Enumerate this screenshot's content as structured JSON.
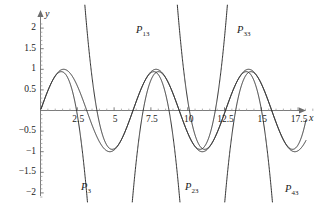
{
  "chart_data": {
    "type": "line",
    "title": "",
    "xlabel": "x",
    "ylabel": "y",
    "xlim": [
      -0.6,
      19.2
    ],
    "ylim": [
      -2.15,
      2.2
    ],
    "grid": false,
    "legend_position": "inline-curve-labels",
    "x_ticks": [
      2.5,
      5,
      7.5,
      10,
      12.5,
      15,
      17.5
    ],
    "x_tick_labels": [
      "2.5",
      "5",
      "7.5",
      "10",
      "12.5",
      "15",
      "17.5"
    ],
    "y_ticks": [
      2,
      1.5,
      1,
      0.5,
      -0.5,
      -1,
      -1.5,
      -2
    ],
    "y_tick_labels": [
      "2",
      "1.5",
      "1",
      "0.5",
      "-0.5",
      "-1",
      "-1.5",
      "-2"
    ],
    "series": [
      {
        "name": "sin(x)",
        "label": "",
        "kind": "reference-sine",
        "amplitude": 1,
        "period": 6.283185,
        "maxima_x": [
          1.5708,
          7.854,
          14.137
        ],
        "minima_x": [
          4.712,
          10.996
        ],
        "zeros_x": [
          0,
          3.1416,
          6.2832,
          9.4248,
          12.566,
          15.708,
          18.85
        ]
      },
      {
        "name": "P3",
        "label": "P",
        "sub": "3",
        "kind": "taylor-degree-3",
        "center": 0,
        "description": "x - x^3/6"
      },
      {
        "name": "P13",
        "label": "P",
        "sub": "13",
        "kind": "taylor-degree-3",
        "center": 6.2832,
        "description": "(x-2pi) - (x-2pi)^3/6"
      },
      {
        "name": "P23",
        "label": "P",
        "sub": "23",
        "kind": "taylor-degree-3",
        "center": 9.4248,
        "description": "-(x-3pi) + (x-3pi)^3/6"
      },
      {
        "name": "P33",
        "label": "P",
        "sub": "33",
        "kind": "taylor-degree-3",
        "center": 12.566,
        "description": "(x-4pi) - (x-4pi)^3/6"
      },
      {
        "name": "P43",
        "label": "P",
        "sub": "43",
        "kind": "taylor-degree-3",
        "center": 15.708,
        "description": "-(x-5pi) + (x-5pi)^3/6"
      }
    ],
    "curve_labels": [
      {
        "name": "P3",
        "base": "P",
        "sub": "3",
        "x_px": 81,
        "y_px": 182
      },
      {
        "name": "P13",
        "base": "P",
        "sub": "13",
        "x_px": 136,
        "y_px": 25
      },
      {
        "name": "P23",
        "base": "P",
        "sub": "23",
        "x_px": 185,
        "y_px": 182
      },
      {
        "name": "P33",
        "base": "P",
        "sub": "33",
        "x_px": 237,
        "y_px": 25
      },
      {
        "name": "P43",
        "base": "P",
        "sub": "43",
        "x_px": 285,
        "y_px": 184
      }
    ]
  },
  "axes": {
    "x_axis_label": "x",
    "y_axis_label": "y",
    "stroke_color": "#6e6e6e",
    "curve_color": "#262626"
  }
}
